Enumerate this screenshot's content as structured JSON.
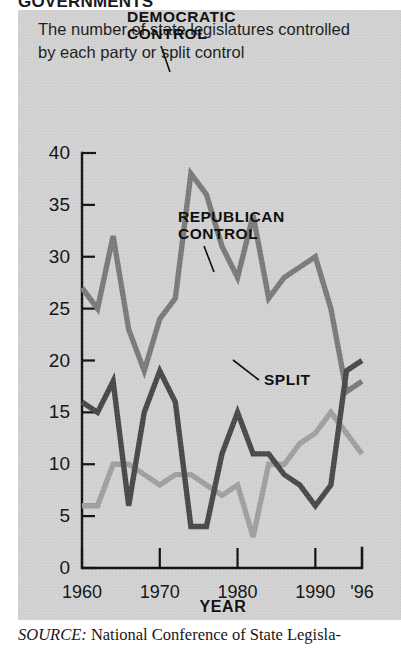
{
  "kicker": "GOVERNMENTS",
  "deck": "The number of state legislatures controlled by each party or split control",
  "source": {
    "label": "SOURCE:",
    "text": "National Conference of State Legisla-"
  },
  "annotations": {
    "democratic": {
      "line1": "DEMOCRATIC",
      "line2": "CONTROL"
    },
    "republican": {
      "line1": "REPUBLICAN",
      "line2": "CONTROL"
    },
    "split": {
      "line1": "SPLIT"
    }
  },
  "colors": {
    "panel": "#d2d2d2",
    "democratic": "#7b7b7b",
    "republican": "#4a4a4a",
    "split": "#a0a0a0",
    "axis": "#111111"
  },
  "chart_data": {
    "type": "line",
    "title": "The number of state legislatures controlled by each party or split control",
    "xlabel": "YEAR",
    "ylabel": "",
    "xlim": [
      1960,
      1996
    ],
    "ylim": [
      0,
      40
    ],
    "grid": false,
    "legend": "inline-annotations",
    "ytick_labels": [
      "0",
      "5",
      "10",
      "15",
      "20",
      "25",
      "30",
      "35",
      "40"
    ],
    "ytick_values": [
      0,
      5,
      10,
      15,
      20,
      25,
      30,
      35,
      40
    ],
    "xtick_labels": [
      "1960",
      "1970",
      "1980",
      "1990",
      "'96"
    ],
    "xtick_values": [
      1960,
      1970,
      1980,
      1990,
      1996
    ],
    "x": [
      1960,
      1962,
      1964,
      1966,
      1968,
      1970,
      1972,
      1974,
      1976,
      1978,
      1980,
      1982,
      1984,
      1986,
      1988,
      1990,
      1992,
      1994,
      1996
    ],
    "series": [
      {
        "name": "DEMOCRATIC CONTROL",
        "color": "#7b7b7b",
        "values": [
          27,
          25,
          32,
          23,
          19,
          24,
          26,
          38,
          36,
          31,
          28,
          34,
          26,
          28,
          29,
          30,
          25,
          17,
          18
        ]
      },
      {
        "name": "REPUBLICAN CONTROL",
        "color": "#4a4a4a",
        "values": [
          16,
          15,
          18,
          6,
          15,
          19,
          16,
          4,
          4,
          11,
          15,
          11,
          11,
          9,
          8,
          6,
          8,
          19,
          20
        ]
      },
      {
        "name": "SPLIT",
        "color": "#a0a0a0",
        "values": [
          6,
          6,
          10,
          10,
          9,
          8,
          9,
          9,
          8,
          7,
          8,
          3,
          10,
          10,
          12,
          13,
          15,
          13,
          11
        ]
      }
    ]
  }
}
